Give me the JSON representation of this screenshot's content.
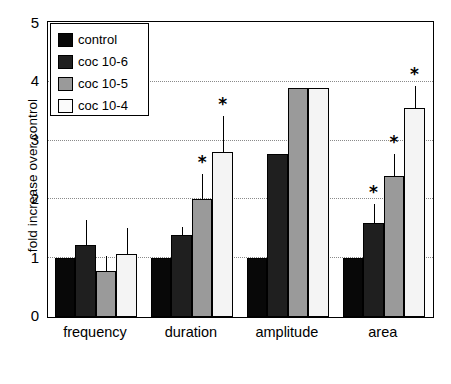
{
  "chart_data": {
    "type": "bar",
    "title": "",
    "xlabel": "",
    "ylabel": "fold increase over control",
    "ylim": [
      0,
      5
    ],
    "yticks": [
      0,
      1,
      2,
      3,
      4,
      5
    ],
    "gridlines": [
      1,
      2,
      3,
      4
    ],
    "grid": true,
    "legend_position": "top-left",
    "categories": [
      "frequency",
      "duration",
      "amplitude",
      "area"
    ],
    "series": [
      {
        "name": "control",
        "color": "#080808",
        "values": [
          1.0,
          1.0,
          1.0,
          1.0
        ],
        "errors": [
          0,
          0,
          0,
          0
        ],
        "significant": [
          false,
          false,
          false,
          false
        ]
      },
      {
        "name": "coc 10-6",
        "color": "#1f1f1f",
        "values": [
          1.22,
          1.4,
          2.78,
          1.6
        ],
        "errors": [
          0.43,
          0.14,
          0,
          0.32
        ],
        "significant": [
          false,
          false,
          false,
          true
        ]
      },
      {
        "name": "coc 10-5",
        "color": "#9a9a9a",
        "values": [
          0.78,
          2.0,
          3.9,
          2.4
        ],
        "errors": [
          0.25,
          0.43,
          0,
          0.38
        ],
        "significant": [
          false,
          true,
          false,
          true
        ]
      },
      {
        "name": "coc 10-4",
        "color": "#f4f4f4",
        "values": [
          1.07,
          2.8,
          3.9,
          3.55
        ],
        "errors": [
          0.45,
          0.62,
          0,
          0.38
        ],
        "significant": [
          false,
          true,
          false,
          true
        ]
      }
    ],
    "annotation_symbol": "*"
  },
  "axis": {
    "y_title": "fold increase over control",
    "y_tick_labels": [
      "0",
      "1",
      "2",
      "3",
      "4",
      "5"
    ],
    "x_tick_labels": [
      "frequency",
      "duration",
      "amplitude",
      "area"
    ]
  },
  "legend": {
    "entries": [
      {
        "label": "control"
      },
      {
        "label": "coc 10-6"
      },
      {
        "label": "coc 10-5"
      },
      {
        "label": "coc 10-4"
      }
    ]
  }
}
